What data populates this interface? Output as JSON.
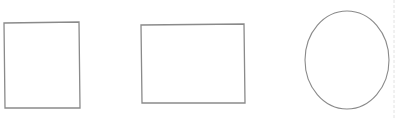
{
  "canvas": {
    "width": 401,
    "height": 119,
    "background": "#ffffff"
  },
  "stroke_color": "#8a8a8a",
  "divider_color": "#e2e2e2",
  "shapes": [
    {
      "type": "polygon",
      "name": "tall-rectangle",
      "points": "4,23 79,22 80,108 5,108"
    },
    {
      "type": "polygon",
      "name": "wide-rectangle",
      "points": "141,25 244,24 245,103 142,103"
    },
    {
      "type": "ellipse",
      "name": "ellipse",
      "cx": 347,
      "cy": 60,
      "rx": 42,
      "ry": 49
    }
  ],
  "divider": {
    "x": 394,
    "y1": 0,
    "y2": 119
  }
}
